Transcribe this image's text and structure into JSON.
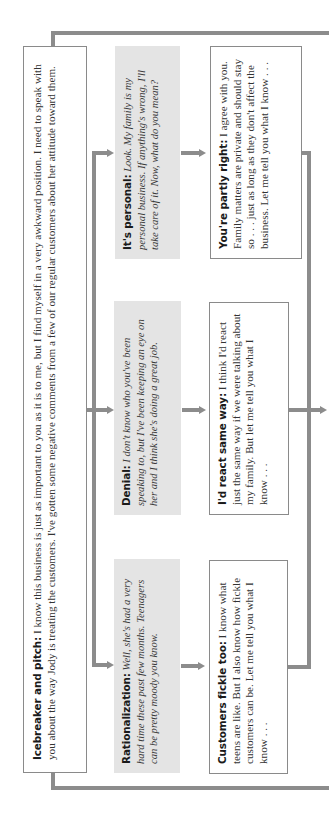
{
  "diagram": {
    "icebreaker": {
      "label": "Icebreaker and pitch:",
      "text": " I know this business is just as important to you as it is to me, but I find myself in a very awkward position. I need to speak with you about the way Jody is treating the customers. I've gotten some negative comments from a few of our regular customers about her attitude toward them."
    },
    "objections": [
      {
        "label": "Rationalization:",
        "text": " Well, she's had a very hard time these past few months. Teenagers can be pretty moody you know."
      },
      {
        "label": "Denial:",
        "text": " I don't know who you've been speaking to, but I've been keeping an eye on her and I think she's doing a great job."
      },
      {
        "label": "It's personal:",
        "text": " Look. My family is my personal business. If anything's wrong, I'll take care of it. Now, what do you mean?"
      }
    ],
    "responses": [
      {
        "label": "Customers fickle too:",
        "text": " I know what teens are like. But I also know how fickle customers can be.  Let me tell you what I know . . ."
      },
      {
        "label": "I'd react same way:",
        "text": " I think I'd react just the same way if we were talking about my family. But let me tell you what I know . . ."
      },
      {
        "label": "You're partly right:",
        "text": " I agree with you. Family matters are private and should stay so . . . just as long as they don't affect the business. Let me tell you what I know . . ."
      }
    ],
    "colors": {
      "connector": "#8c8c8c",
      "objection_fill": "#e4e4e4",
      "response_border": "#8a8a8a"
    }
  }
}
